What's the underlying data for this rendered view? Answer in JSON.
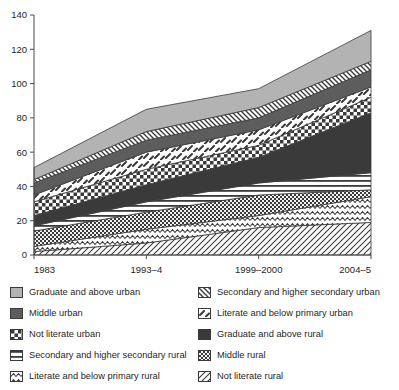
{
  "chart_data": {
    "type": "area",
    "stacked": true,
    "title": "",
    "xlabel": "",
    "ylabel": "",
    "categories": [
      "1983",
      "1993–4",
      "1999–2000",
      "2004–5"
    ],
    "x": [
      0,
      1,
      2,
      3
    ],
    "ylim": [
      0,
      140
    ],
    "ytick_values": [
      0,
      20,
      40,
      60,
      80,
      100,
      120,
      140
    ],
    "ytick_labels": [
      "0",
      "20",
      "40",
      "60",
      "80",
      "100",
      "120",
      "140"
    ],
    "grid": false,
    "legend_position": "below",
    "series": [
      {
        "name": "Not literate rural",
        "key": "not_literate_rural",
        "pattern": "fine-diagonal",
        "values": [
          2,
          7,
          16,
          19
        ]
      },
      {
        "name": "Literate and below primary rural",
        "key": "lit_below_primary_rural",
        "pattern": "wavy",
        "values": [
          5,
          15,
          23,
          34
        ]
      },
      {
        "name": "Middle rural",
        "key": "middle_rural",
        "pattern": "dense-checker",
        "values": [
          14,
          25,
          35,
          38
        ]
      },
      {
        "name": "Secondary and higher secondary rural",
        "key": "secondary_rural",
        "pattern": "horizontal-lines",
        "values": [
          17,
          31,
          42,
          48
        ]
      },
      {
        "name": "Graduate and above rural",
        "key": "graduate_rural",
        "pattern": "solid-dark",
        "values": [
          23,
          41,
          57,
          83
        ]
      },
      {
        "name": "Not literate urban",
        "key": "not_literate_urban",
        "pattern": "checker",
        "values": [
          31,
          50,
          64,
          92
        ]
      },
      {
        "name": "Literate and below primary urban",
        "key": "lit_below_primary_urban",
        "pattern": "dash-marks",
        "values": [
          35,
          60,
          73,
          98
        ]
      },
      {
        "name": "Middle urban",
        "key": "middle_urban",
        "pattern": "solid-midgray",
        "values": [
          42,
          67,
          80,
          108
        ]
      },
      {
        "name": "Secondary and higher secondary urban",
        "key": "secondary_urban",
        "pattern": "diagonal-hatch",
        "values": [
          44,
          72,
          86,
          113
        ]
      },
      {
        "name": "Graduate and above urban",
        "key": "graduate_urban",
        "pattern": "solid-lightgray",
        "values": [
          51,
          85,
          97,
          131
        ]
      }
    ]
  },
  "axes": {
    "y_ticks": [
      "140",
      "120",
      "100",
      "80",
      "60",
      "40",
      "20",
      "0"
    ],
    "x_ticks": [
      "1983",
      "1993–4",
      "1999–2000",
      "2004–5"
    ]
  },
  "legend": {
    "left_column": [
      {
        "label": "Graduate and above urban",
        "pattern": "solid-lightgray"
      },
      {
        "label": "Middle urban",
        "pattern": "solid-midgray"
      },
      {
        "label": "Not literate urban",
        "pattern": "checker"
      },
      {
        "label": "Secondary and higher secondary rural",
        "pattern": "horizontal-lines"
      },
      {
        "label": "Literate and below primary rural",
        "pattern": "wavy"
      }
    ],
    "right_column": [
      {
        "label": "Secondary and higher secondary urban",
        "pattern": "diagonal-hatch"
      },
      {
        "label": "Literate and below primary urban",
        "pattern": "dash-marks"
      },
      {
        "label": "Graduate and above rural",
        "pattern": "solid-dark"
      },
      {
        "label": "Middle rural",
        "pattern": "dense-checker"
      },
      {
        "label": "Not literate rural",
        "pattern": "fine-diagonal"
      }
    ]
  },
  "colors": {
    "light_gray": "#b3b3b3",
    "mid_gray": "#5d5d5d",
    "dark": "#3a3a3a",
    "axis": "#4a4a4a",
    "text": "#1f1f1f",
    "white": "#ffffff"
  }
}
